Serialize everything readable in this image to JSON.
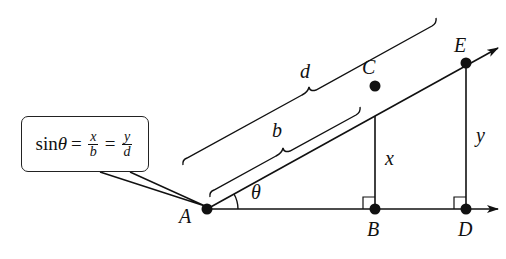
{
  "diagram": {
    "type": "geometry-similar-triangles",
    "points": {
      "A": {
        "label": "A"
      },
      "B": {
        "label": "B"
      },
      "C": {
        "label": "C"
      },
      "D": {
        "label": "D"
      },
      "E": {
        "label": "E"
      }
    },
    "angle_label": "θ",
    "segment_labels": {
      "AC": "b",
      "AE": "d",
      "BC": "x",
      "DE": "y"
    },
    "formula": {
      "func": "sin",
      "var": "θ",
      "eq": "=",
      "frac1": {
        "num": "x",
        "den": "b"
      },
      "frac2": {
        "num": "y",
        "den": "d"
      }
    },
    "colors": {
      "stroke": "#111111",
      "background": "#ffffff"
    }
  }
}
